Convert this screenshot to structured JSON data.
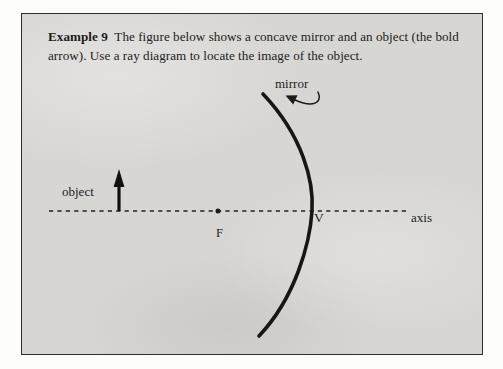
{
  "page": {
    "background_color": "#ffffff",
    "paper_color": "#d8d6d3",
    "ink_color": "#1c1c1c",
    "border_color": "#2e2e2e"
  },
  "caption": {
    "lead": "Example 9",
    "body": "The figure below shows a concave mirror and an object (the bold arrow). Use a ray diagram to locate the image of the object."
  },
  "diagram": {
    "labels": {
      "object": "object",
      "axis": "axis",
      "mirror": "mirror",
      "focal_point": "F",
      "vertex": "V"
    },
    "elements": {
      "optical_axis": "dashed-horizontal-line",
      "object_arrow": "bold-up-arrow",
      "mirror_arc": "concave-mirror-arc",
      "focal_point_dot": "filled-dot",
      "mirror_pointer": "curved-arrow"
    },
    "geometry": {
      "axis_y": 197,
      "axis_x_start": 27,
      "axis_x_end": 384,
      "object_x": 97,
      "object_top_y": 158,
      "focal_point_x": 196,
      "vertex_x": 290,
      "mirror_top": [
        241,
        80
      ],
      "mirror_bottom": [
        237,
        322
      ]
    }
  }
}
